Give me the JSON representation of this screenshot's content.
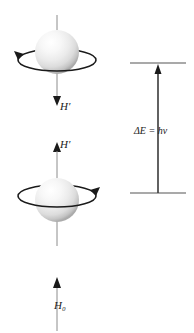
{
  "figure": {
    "background_color": "#ffffff",
    "ink_color": "#1a1a1a",
    "axis_color": "#8c8c8c",
    "level_color": "#8c8c8c",
    "sphere_highlight_color": "#ffffff",
    "sphere_shadow_color": "#9a9a9a"
  },
  "spin_states": [
    {
      "name": "upper-spin-state",
      "field_label": "H′",
      "field_direction": "down",
      "precession_direction": "counterclockwise",
      "arrowhead_side": "left",
      "sphere_center_x": 57,
      "sphere_center_y": 52,
      "sphere_radius": 22
    },
    {
      "name": "lower-spin-state",
      "field_label": "H′",
      "field_direction": "up",
      "precession_direction": "clockwise",
      "arrowhead_side": "right",
      "sphere_center_x": 57,
      "sphere_center_y": 200,
      "sphere_radius": 22
    }
  ],
  "external_field": {
    "label": "H₀",
    "direction": "up",
    "line_x": 57,
    "line_top": 277,
    "line_bottom": 330
  },
  "energy_diagram": {
    "transition_label": "ΔE = hν",
    "upper_level": {
      "name": "upper-energy-level",
      "y": 63,
      "x_start": 130,
      "x_end": 186
    },
    "lower_level": {
      "name": "lower-energy-level",
      "y": 193,
      "x_start": 130,
      "x_end": 186
    },
    "arrow": {
      "name": "transition-arrow",
      "x": 158,
      "y_start": 193,
      "y_end": 66,
      "direction": "up"
    }
  }
}
